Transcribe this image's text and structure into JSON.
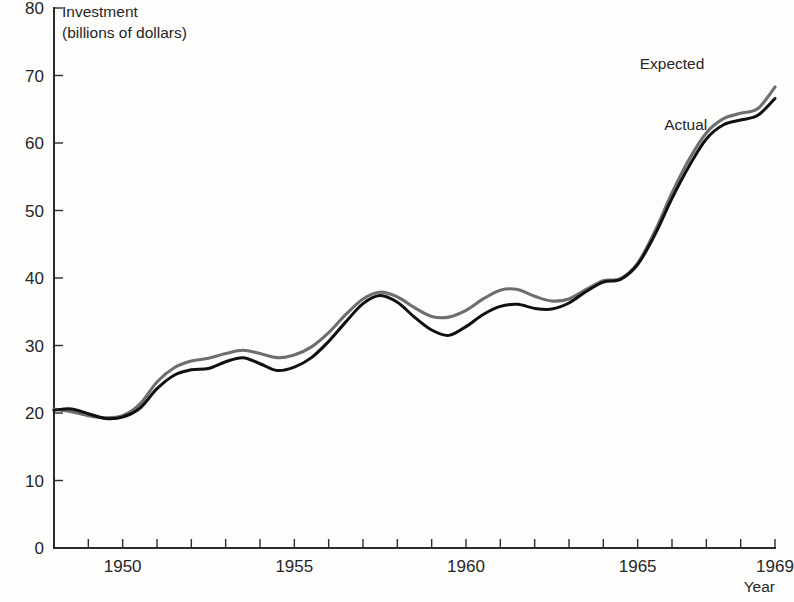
{
  "chart_data": {
    "type": "line",
    "title": "",
    "ylabel": "Investment",
    "ylabel_sub": "(billions of dollars)",
    "xlabel": "Year",
    "xlim": [
      1948,
      1969
    ],
    "ylim": [
      0,
      80
    ],
    "grid": false,
    "legend_position": "inline-right",
    "y_ticks": [
      0,
      10,
      20,
      30,
      40,
      50,
      60,
      70,
      80
    ],
    "y_tick_labels": [
      "0",
      "10",
      "20",
      "30",
      "40",
      "50",
      "60",
      "70",
      "80"
    ],
    "x_ticks": [
      1948,
      1949,
      1950,
      1951,
      1952,
      1953,
      1954,
      1955,
      1956,
      1957,
      1958,
      1959,
      1960,
      1961,
      1962,
      1963,
      1964,
      1965,
      1966,
      1967,
      1968,
      1969
    ],
    "x_tick_labels": [
      "",
      "",
      "1950",
      "",
      "",
      "",
      "",
      "1955",
      "",
      "",
      "",
      "",
      "1960",
      "",
      "",
      "",
      "",
      "1965",
      "",
      "",
      "",
      "1969"
    ],
    "x": [
      1948,
      1948.5,
      1949,
      1949.5,
      1950,
      1950.5,
      1951,
      1951.5,
      1952,
      1952.5,
      1953,
      1953.5,
      1954,
      1954.5,
      1955,
      1955.5,
      1956,
      1956.5,
      1957,
      1957.5,
      1958,
      1958.5,
      1959,
      1959.5,
      1960,
      1960.5,
      1961,
      1961.5,
      1962,
      1962.5,
      1963,
      1963.5,
      1964,
      1964.5,
      1965,
      1965.5,
      1966,
      1966.5,
      1967,
      1967.5,
      1968,
      1968.5,
      1969
    ],
    "series": [
      {
        "name": "Expected",
        "color": "#6e6e6e",
        "label_x": 1966.0,
        "label_y": 71.0,
        "values": [
          20.6,
          20.2,
          19.6,
          19.3,
          19.6,
          21.3,
          24.6,
          26.7,
          27.7,
          28.1,
          28.8,
          29.3,
          28.8,
          28.2,
          28.6,
          29.8,
          31.9,
          34.6,
          36.9,
          37.9,
          37.2,
          35.6,
          34.3,
          34.2,
          35.2,
          36.9,
          38.2,
          38.3,
          37.3,
          36.6,
          36.9,
          38.3,
          39.6,
          39.9,
          42.2,
          46.9,
          52.6,
          57.6,
          61.5,
          63.6,
          64.4,
          65.1,
          68.3
        ]
      },
      {
        "name": "Actual",
        "color": "#101010",
        "label_x": 1966.4,
        "label_y": 62.0,
        "values": [
          20.4,
          20.6,
          19.9,
          19.2,
          19.4,
          20.7,
          23.6,
          25.6,
          26.4,
          26.6,
          27.6,
          28.2,
          27.3,
          26.3,
          26.8,
          28.2,
          30.6,
          33.5,
          36.2,
          37.4,
          36.4,
          34.2,
          32.3,
          31.5,
          32.8,
          34.6,
          35.8,
          36.1,
          35.5,
          35.4,
          36.3,
          38.0,
          39.4,
          39.8,
          42.0,
          46.4,
          51.8,
          56.6,
          60.6,
          62.7,
          63.4,
          64.1,
          66.6
        ]
      }
    ],
    "expected_tail_x": [
      1969,
      1969.0
    ],
    "annotations": []
  },
  "axis": {
    "y_title_line1": "Investment",
    "y_title_line2": "(billions of dollars)",
    "x_title": "Year"
  },
  "legend": {
    "expected_label": "Expected",
    "actual_label": "Actual"
  }
}
